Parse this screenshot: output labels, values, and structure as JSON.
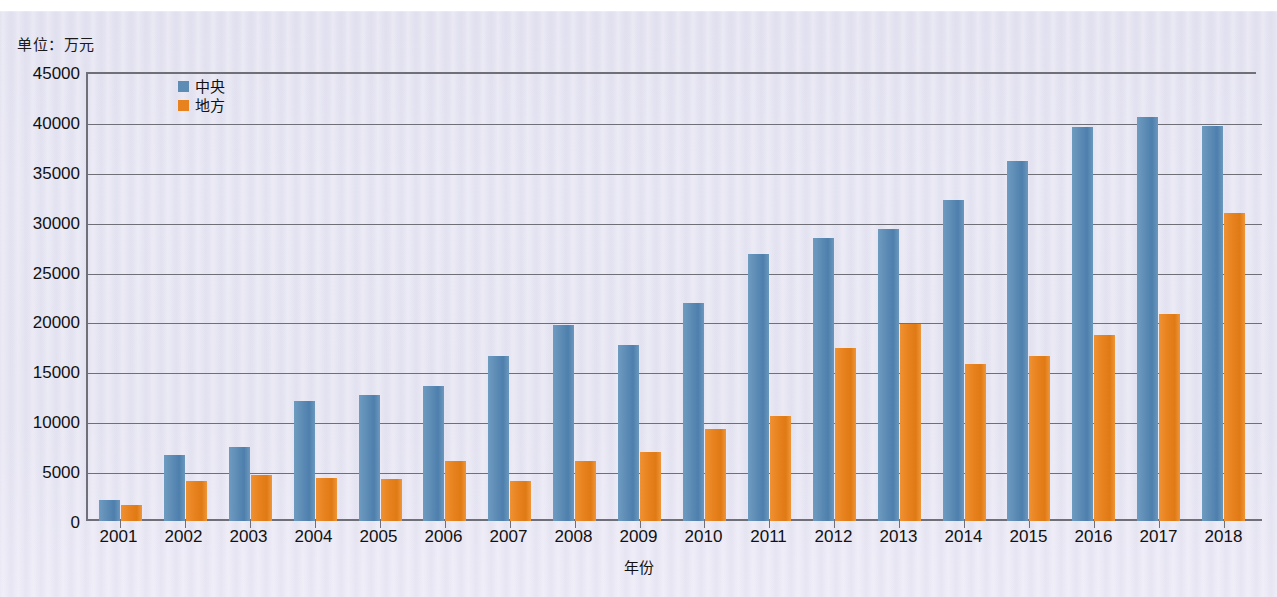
{
  "unit_label": "单位：万元",
  "legend": {
    "position": "top-left-inside",
    "items": [
      {
        "key": "central",
        "label": "中央",
        "color": "#5d8cb5"
      },
      {
        "key": "local",
        "label": "地方",
        "color": "#e8821e"
      }
    ]
  },
  "axis": {
    "x_title": "年份",
    "y_ticks": [
      "45000",
      "40000",
      "35000",
      "30000",
      "25000",
      "20000",
      "15000",
      "10000",
      "5000",
      "0"
    ]
  },
  "chart_data": {
    "type": "bar",
    "title": "",
    "subtitle": "",
    "xlabel": "年份",
    "ylabel": "",
    "unit": "万元",
    "ylim": [
      0,
      45000
    ],
    "ytick_step": 5000,
    "grid": true,
    "legend_position": "top-left-inside",
    "categories": [
      "2001",
      "2002",
      "2003",
      "2004",
      "2005",
      "2006",
      "2007",
      "2008",
      "2009",
      "2010",
      "2011",
      "2012",
      "2013",
      "2014",
      "2015",
      "2016",
      "2017",
      "2018"
    ],
    "series": [
      {
        "name": "中央",
        "color": "#5d8cb5",
        "values": [
          2100,
          6600,
          7400,
          12000,
          12600,
          13500,
          16500,
          19600,
          17600,
          21900,
          26800,
          28400,
          29300,
          32200,
          36100,
          39500,
          40500,
          39600
        ]
      },
      {
        "name": "地方",
        "color": "#e8821e",
        "values": [
          1600,
          4000,
          4600,
          4300,
          4200,
          6000,
          4000,
          6000,
          6900,
          9200,
          10500,
          17300,
          19700,
          15700,
          16500,
          18600,
          20700,
          30900
        ]
      }
    ]
  }
}
